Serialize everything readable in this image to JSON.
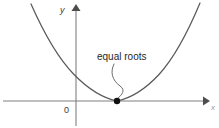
{
  "figure": {
    "name": "equal-roots-parabola-diagram",
    "width": 219,
    "height": 128,
    "background_color": "#ffffff"
  },
  "axes": {
    "x_axis": {
      "label": "x",
      "label_x": 211,
      "label_y": 110,
      "line_y": 101,
      "line_x_start": 3,
      "line_x_end": 203,
      "arrow_tip_x": 210,
      "color": "#808080"
    },
    "y_axis": {
      "label": "y",
      "label_x": 60,
      "label_y": 13,
      "line_x": 76,
      "line_y_start": 11,
      "line_y_end": 126,
      "arrow_tip_y": 4,
      "color": "#808080"
    },
    "origin": {
      "label": "0",
      "label_x": 64,
      "label_y": 113,
      "x": 76,
      "y": 101
    }
  },
  "curve": {
    "name": "parabola",
    "color": "#5a5a5a",
    "vertex_x": 117,
    "vertex_y": 101,
    "left_end_x": 31,
    "left_end_y": 4,
    "right_end_x": 200,
    "right_end_y": 3,
    "path": "M 31 4 Q 52.5 52.5 74 74.5 Q 95.5 96.5 117 101 Q 138.5 96.5 159 74.5 Q 179.5 52 200 3"
  },
  "vertex_point": {
    "label": "vertex-tangent-point",
    "x": 117,
    "y": 101,
    "radius": 3.2,
    "color": "#111111"
  },
  "annotation": {
    "text": "equal roots",
    "text_x": 97,
    "text_y": 60,
    "color": "#1f1f1f",
    "leader_path": "M 114 64 C 110 72 112 80 120 86 C 126 90 122 95 117.5 98.5",
    "leader_color": "#6b6b6b"
  }
}
